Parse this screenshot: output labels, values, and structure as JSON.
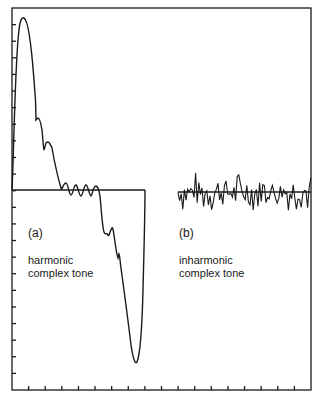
{
  "figure": {
    "panel_a": {
      "tag": "(a)",
      "caption_line1": "harmonic",
      "caption_line2": "complex tone"
    },
    "panel_b": {
      "tag": "(b)",
      "caption_line1": "inharmonic",
      "caption_line2": "complex tone"
    },
    "colors": {
      "ink": "#1a1a1a",
      "background": "#ffffff"
    }
  },
  "chart_data": {
    "type": "line",
    "title": "",
    "xlabel": "",
    "ylabel": "",
    "grid": false,
    "legend": "none",
    "axis_ticks": {
      "left_y_count": 22,
      "bottom_x_count": 17,
      "tick_labels": "none"
    },
    "series": [
      {
        "name": "harmonic complex tone (a)",
        "description": "single period of a periodic waveform; large positive peak, ripples near zero, deep negative trough",
        "x": [
          0,
          1,
          2,
          3,
          5,
          7,
          9,
          11,
          13,
          15,
          17,
          18,
          20,
          22,
          24,
          26,
          28,
          30,
          32,
          34,
          36,
          38,
          40,
          42,
          44,
          46,
          48,
          50,
          52,
          54,
          56,
          58,
          60,
          62,
          64,
          66,
          68,
          70,
          72,
          74,
          76,
          78,
          80,
          82,
          84,
          86,
          88,
          90,
          92,
          94,
          96,
          98,
          100,
          102,
          104,
          106,
          108,
          110,
          112,
          114,
          116,
          118,
          120,
          122,
          124,
          126,
          128,
          130,
          132,
          133
        ],
        "y": [
          0,
          30,
          70,
          120,
          150,
          165,
          172,
          168,
          150,
          120,
          85,
          70,
          72,
          55,
          40,
          50,
          52,
          30,
          15,
          3,
          0,
          8,
          10,
          0,
          -4,
          12,
          2,
          -6,
          10,
          0,
          -6,
          10,
          2,
          -10,
          0,
          8,
          5,
          -20,
          -40,
          -45,
          -42,
          -46,
          -38,
          -55,
          -70,
          -68,
          -90,
          -110,
          -130,
          -150,
          -165,
          -172,
          -170,
          -150,
          -110,
          -60,
          -20,
          0,
          0,
          0,
          0,
          0,
          0,
          0,
          0,
          0,
          0,
          0,
          0,
          0
        ]
      },
      {
        "name": "inharmonic complex tone (b)",
        "description": "noise-like aperiodic waveform centered on zero, amplitude about +/-20",
        "x_range": [
          0,
          133
        ],
        "y_range": [
          -22,
          22
        ]
      }
    ]
  }
}
